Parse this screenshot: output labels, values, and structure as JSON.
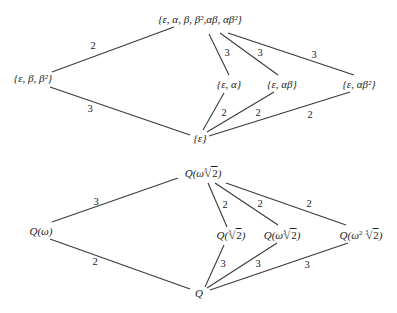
{
  "diagrams": [
    {
      "name": "galois-group-subgroup-lattice",
      "nodes": {
        "top": "{ε, α, β, β²,αβ, αβ²}",
        "left": "{ε,  β, β²}",
        "mid1": "{ε, α}",
        "mid2": "{ε, αβ}",
        "mid3": "{ε, αβ²}",
        "bottom": "{ε}"
      },
      "edge_labels": {
        "top_left": "2",
        "left_bottom": "3",
        "top_mid1": "3",
        "top_mid2": "3",
        "top_mid3": "3",
        "mid1_bottom": "2",
        "mid2_bottom": "2",
        "mid3_bottom": "2"
      }
    },
    {
      "name": "field-extension-lattice",
      "nodes": {
        "top_prefix": "Q(ω",
        "top_radicand": "2",
        "top_index": "3",
        "top_suffix": ")",
        "left": "Q(ω)",
        "mid1_prefix": "Q(",
        "mid1_radicand": "2",
        "mid1_index": "3",
        "mid1_suffix": ")",
        "mid2_prefix": "Q(ω",
        "mid2_radicand": "2",
        "mid2_index": "3",
        "mid2_suffix": ")",
        "mid3_prefix": "Q(ω",
        "mid3_power": "2",
        "mid3_radicand": "2",
        "mid3_index": "3",
        "mid3_suffix": ")",
        "bottom": "Q"
      },
      "edge_labels": {
        "top_left": "3",
        "left_bottom": "2",
        "top_mid1": "2",
        "top_mid2": "2",
        "top_mid3": "2",
        "mid1_bottom": "3",
        "mid2_bottom": "3",
        "mid3_bottom": "3"
      }
    }
  ]
}
